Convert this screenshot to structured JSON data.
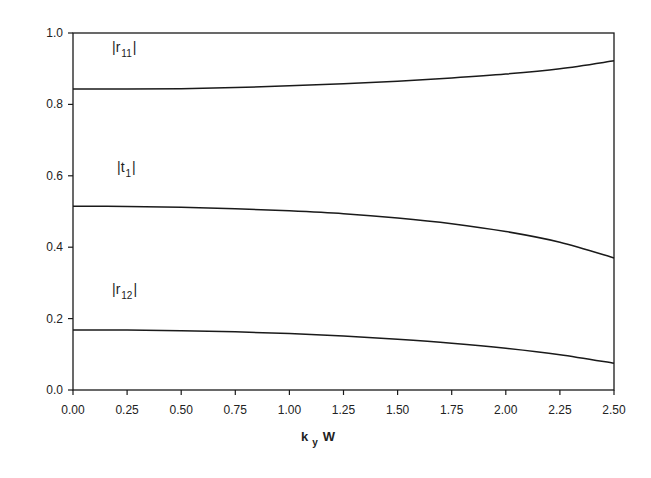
{
  "chart_data": {
    "type": "line",
    "title": "",
    "xlabel": "k_y W",
    "xlabel_main": "k",
    "xlabel_sub": "y",
    "xlabel_tail": "W",
    "ylabel": "",
    "xlim": [
      0.0,
      2.5
    ],
    "ylim": [
      0.0,
      1.0
    ],
    "grid": false,
    "legend": "inline labels",
    "x_ticks": [
      "0.00",
      "0.25",
      "0.50",
      "0.75",
      "1.00",
      "1.25",
      "1.50",
      "1.75",
      "2.00",
      "2.25",
      "2.50"
    ],
    "y_ticks": [
      "0.0",
      "0.2",
      "0.4",
      "0.6",
      "0.8",
      "1.0"
    ],
    "x": [
      0.0,
      0.25,
      0.5,
      0.75,
      1.0,
      1.25,
      1.5,
      1.75,
      2.0,
      2.25,
      2.5
    ],
    "series": [
      {
        "name": "|r11|",
        "label_main": "|r",
        "label_sub": "11",
        "label_tail": "|",
        "values": [
          0.843,
          0.843,
          0.844,
          0.847,
          0.852,
          0.858,
          0.865,
          0.874,
          0.885,
          0.9,
          0.922
        ]
      },
      {
        "name": "|t1|",
        "label_main": "|t",
        "label_sub": "1",
        "label_tail": "|",
        "values": [
          0.515,
          0.514,
          0.512,
          0.508,
          0.502,
          0.494,
          0.482,
          0.466,
          0.444,
          0.414,
          0.37
        ]
      },
      {
        "name": "|r12|",
        "label_main": "|r",
        "label_sub": "12",
        "label_tail": "|",
        "values": [
          0.168,
          0.168,
          0.166,
          0.163,
          0.158,
          0.151,
          0.142,
          0.131,
          0.117,
          0.099,
          0.075
        ]
      }
    ]
  },
  "colors": {
    "line": "#1a1a1a",
    "background": "#ffffff"
  }
}
